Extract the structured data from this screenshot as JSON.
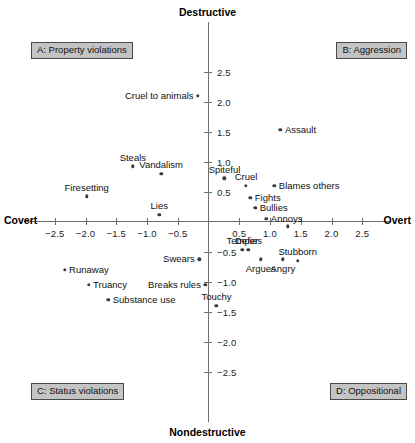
{
  "chart_data": {
    "type": "scatter",
    "title": "",
    "xlabel_left": "Covert",
    "xlabel_right": "Overt",
    "ylabel_top": "Destructive",
    "ylabel_bottom": "Nondestructive",
    "xlim": [
      -2.75,
      2.75
    ],
    "ylim": [
      -2.75,
      2.75
    ],
    "grid": false,
    "legend": "none",
    "xticks": [
      "-2.5",
      "-2.0",
      "-1.5",
      "-1.0",
      "-0.5",
      "0.5",
      "1.0",
      "1.5",
      "2.0",
      "2.5"
    ],
    "xtickvalues": [
      -2.5,
      -2.0,
      -1.5,
      -1.0,
      -0.5,
      0.5,
      1.0,
      1.5,
      2.0,
      2.5
    ],
    "yticks": [
      "2.5",
      "2.0",
      "1.5",
      "1.0",
      "0.5",
      "-0.5",
      "-1.0",
      "-1.5",
      "-2.0",
      "-2.5"
    ],
    "ytickvalues": [
      2.5,
      2.0,
      1.5,
      1.0,
      0.5,
      -0.5,
      -1.0,
      -1.5,
      -2.0,
      -2.5
    ],
    "quadrants": [
      {
        "id": "A",
        "label": "A: Property violations"
      },
      {
        "id": "B",
        "label": "B: Aggression"
      },
      {
        "id": "C",
        "label": "C: Status violations"
      },
      {
        "id": "D",
        "label": "D: Oppositional"
      }
    ],
    "points": [
      {
        "label": "Cruel to animals",
        "x": -0.17,
        "y": 2.1,
        "label_pos": "left"
      },
      {
        "label": "Assault",
        "x": 1.17,
        "y": 1.53,
        "label_pos": "right"
      },
      {
        "label": "Steals",
        "x": -1.23,
        "y": 0.92,
        "label_pos": "above"
      },
      {
        "label": "Vandalism",
        "x": -0.77,
        "y": 0.8,
        "label_pos": "above"
      },
      {
        "label": "Spiteful",
        "x": 0.26,
        "y": 0.72,
        "label_pos": "above"
      },
      {
        "label": "Cruel",
        "x": 0.61,
        "y": 0.6,
        "label_pos": "above"
      },
      {
        "label": "Blames others",
        "x": 1.07,
        "y": 0.6,
        "label_pos": "right"
      },
      {
        "label": "Firesetting",
        "x": -1.98,
        "y": 0.42,
        "label_pos": "above"
      },
      {
        "label": "Fights",
        "x": 0.68,
        "y": 0.4,
        "label_pos": "right"
      },
      {
        "label": "Bullies",
        "x": 0.76,
        "y": 0.23,
        "label_pos": "right"
      },
      {
        "label": "Lies",
        "x": -0.8,
        "y": 0.11,
        "label_pos": "above"
      },
      {
        "label": "Annoys",
        "x": 0.94,
        "y": 0.04,
        "label_pos": "right"
      },
      {
        "label": "",
        "x": 1.29,
        "y": -0.08,
        "label_pos": "none"
      },
      {
        "label": "Temper",
        "x": 0.55,
        "y": -0.47,
        "label_pos": "above"
      },
      {
        "label": "Defies",
        "x": 0.65,
        "y": -0.47,
        "label_pos": "above"
      },
      {
        "label": "Swears",
        "x": -0.15,
        "y": -0.63,
        "label_pos": "left"
      },
      {
        "label": "Argues",
        "x": 0.85,
        "y": -0.63,
        "label_pos": "below"
      },
      {
        "label": "Angry",
        "x": 1.21,
        "y": -0.63,
        "label_pos": "below"
      },
      {
        "label": "Stubborn",
        "x": 1.45,
        "y": -0.65,
        "label_pos": "above"
      },
      {
        "label": "Runaway",
        "x": -2.34,
        "y": -0.8,
        "label_pos": "right"
      },
      {
        "label": "Truancy",
        "x": -1.95,
        "y": -1.05,
        "label_pos": "right"
      },
      {
        "label": "Breaks rules",
        "x": -0.05,
        "y": -1.05,
        "label_pos": "left"
      },
      {
        "label": "Substance use",
        "x": -1.63,
        "y": -1.3,
        "label_pos": "right"
      },
      {
        "label": "Touchy",
        "x": 0.13,
        "y": -1.4,
        "label_pos": "above"
      }
    ]
  }
}
